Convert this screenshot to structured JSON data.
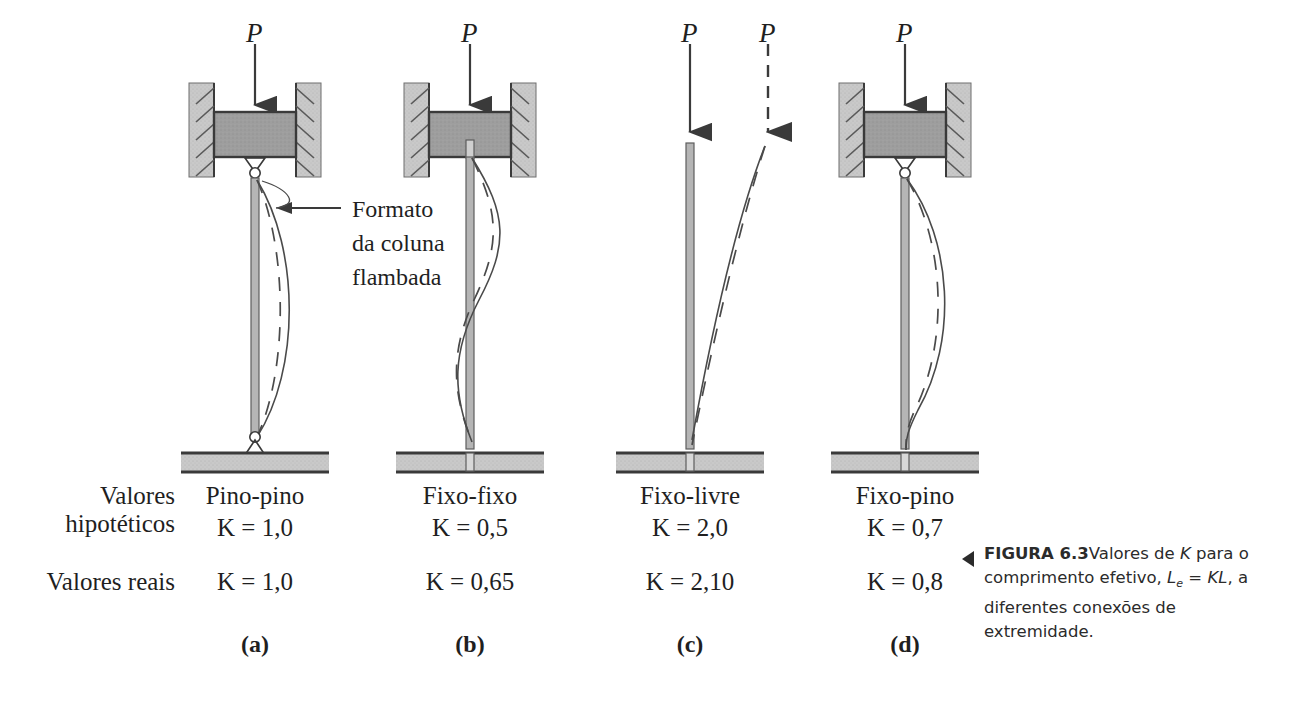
{
  "figure": {
    "load_symbol": "P",
    "annotation": "Formato\nda coluna\nflambada",
    "row_labels": {
      "hypothetical_line1": "Valores",
      "hypothetical_line2": "hipotéticos",
      "real": "Valores reais"
    },
    "cases": [
      {
        "id": "a",
        "sublabel": "(a)",
        "name": "Pino-pino",
        "k_hypothetical": "K = 1,0",
        "k_real": "K = 1,0",
        "top_support": "pinned-in-guided-block",
        "bottom_support": "pinned",
        "center_x": 255
      },
      {
        "id": "b",
        "sublabel": "(b)",
        "name": "Fixo-fixo",
        "k_hypothetical": "K = 0,5",
        "k_real": "K = 0,65",
        "top_support": "fixed-in-guided-block",
        "bottom_support": "fixed",
        "center_x": 470
      },
      {
        "id": "c",
        "sublabel": "(c)",
        "name": "Fixo-livre",
        "k_hypothetical": "K = 2,0",
        "k_real": "K = 2,10",
        "top_support": "free",
        "bottom_support": "fixed",
        "center_x": 690
      },
      {
        "id": "d",
        "sublabel": "(d)",
        "name": "Fixo-pino",
        "k_hypothetical": "K = 0,7",
        "k_real": "K = 0,8",
        "top_support": "pinned-in-guided-block",
        "bottom_support": "fixed",
        "center_x": 905
      }
    ],
    "caption": {
      "figure_number": "FIGURA 6.3",
      "text_part1": "Valores de ",
      "symbol_K": "K",
      "text_part2": " para o comprimento efetivo, ",
      "symbol_Le": "L",
      "symbol_Le_sub": "e",
      "symbol_eq": " = KL",
      "text_part3": ", a diferentes conexões de extremidade."
    },
    "colors": {
      "wall_fill": "#c9c9c9",
      "block_fill": "#9e9e9e",
      "base_fill": "#d0d0d0",
      "column_fill": "#b5b5b5",
      "line": "#3a3a3a",
      "text": "#1f1f1f"
    }
  }
}
